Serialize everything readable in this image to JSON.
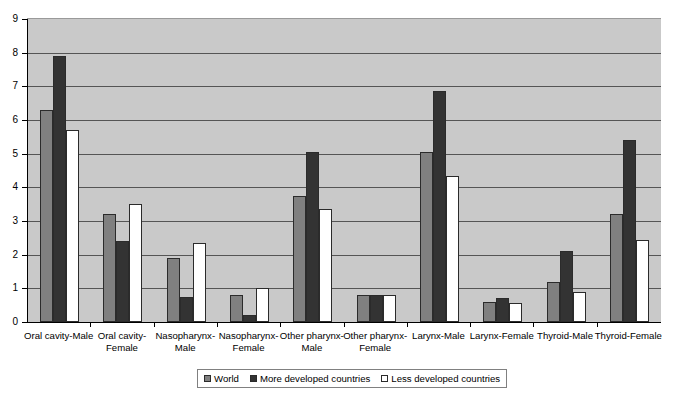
{
  "chart_data": {
    "type": "bar",
    "title": "",
    "subtitle": "",
    "xlabel": "",
    "ylabel": "",
    "ylim": [
      0,
      9
    ],
    "ytick_step": 1,
    "ytick_labels": [
      "0",
      "1",
      "2",
      "3",
      "4",
      "5",
      "6",
      "7",
      "8",
      "9"
    ],
    "grid": true,
    "grid_axis": "y",
    "legend_position": "bottom-center",
    "categories": [
      "Oral cavity-Male",
      "Oral cavity-Female",
      "Nasopharynx-Male",
      "Nasopharynx-Female",
      "Other pharynx-Male",
      "Other pharynx-Female",
      "Larynx-Male",
      "Larynx-Female",
      "Thyroid-Male",
      "Thyroid-Female"
    ],
    "series": [
      {
        "name": "World",
        "color": "#808080",
        "values": [
          6.3,
          3.2,
          1.9,
          0.8,
          3.75,
          0.8,
          5.05,
          0.6,
          1.2,
          3.2
        ]
      },
      {
        "name": "More developed countries",
        "color": "#333333",
        "values": [
          7.9,
          2.4,
          0.75,
          0.2,
          5.05,
          0.8,
          6.85,
          0.7,
          2.1,
          5.4
        ]
      },
      {
        "name": "Less developed countries",
        "color": "#ffffff",
        "values": [
          5.7,
          3.5,
          2.35,
          1.0,
          3.35,
          0.8,
          4.35,
          0.55,
          0.9,
          2.45
        ]
      }
    ]
  },
  "legend": {
    "items": [
      {
        "label": "World",
        "series": "world"
      },
      {
        "label": "More developed countries",
        "series": "more"
      },
      {
        "label": "Less developed countries",
        "series": "less"
      }
    ]
  },
  "colors": {
    "plot_background": "#c9c9c9",
    "gridline": "#555555",
    "axis": "#000000",
    "series_world": "#808080",
    "series_more_developed": "#333333",
    "series_less_developed": "#ffffff"
  }
}
